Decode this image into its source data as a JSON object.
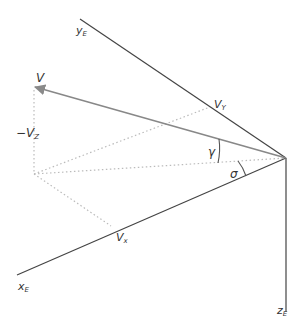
{
  "diagram": {
    "type": "velocity-vector-decomposition",
    "origin": {
      "x": 286,
      "y": 158
    },
    "axes": [
      {
        "id": "yE",
        "label": "y",
        "subscript": "E",
        "end": {
          "x": 80,
          "y": 19
        }
      },
      {
        "id": "xE",
        "label": "x",
        "subscript": "E",
        "end": {
          "x": 17,
          "y": 275
        }
      },
      {
        "id": "zE",
        "label": "z",
        "subscript": "E",
        "end": {
          "x": 286,
          "y": 312
        }
      }
    ],
    "vector": {
      "label": "V",
      "tip": {
        "x": 34,
        "y": 87
      }
    },
    "components": {
      "Vx": {
        "label": "V",
        "subscript": "x",
        "point": {
          "x": 111,
          "y": 226
        }
      },
      "Vy": {
        "label": "V",
        "subscript": "Y",
        "point": {
          "x": 210,
          "y": 107
        }
      },
      "Vz": {
        "label": "−V",
        "subscript": "Z"
      }
    },
    "projection_point": {
      "x": 34,
      "y": 174
    },
    "angles": {
      "gamma": {
        "symbol": "γ"
      },
      "sigma": {
        "symbol": "σ"
      }
    },
    "colors": {
      "axis": "#444444",
      "vector": "#888888",
      "dotted": "#bbbbbb",
      "text": "#333333"
    }
  }
}
